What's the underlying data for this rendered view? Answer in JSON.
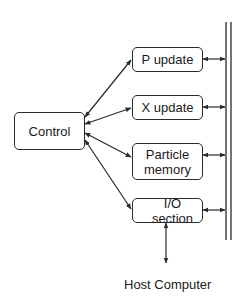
{
  "diagram": {
    "nodes": {
      "control": {
        "label": "Control"
      },
      "p_update": {
        "label": "P update"
      },
      "x_update": {
        "label": "X update"
      },
      "particle_memory": {
        "label": "Particle\nmemory"
      },
      "io_section": {
        "label": "I/O section"
      }
    },
    "external": {
      "host_computer": "Host Computer"
    },
    "edges": [
      {
        "from": "control",
        "to": "p_update",
        "type": "arrow"
      },
      {
        "from": "control",
        "to": "x_update",
        "type": "arrow"
      },
      {
        "from": "control",
        "to": "particle_memory",
        "type": "arrow"
      },
      {
        "from": "control",
        "to": "io_section",
        "type": "arrow"
      },
      {
        "from": "p_update",
        "to": "bus",
        "type": "bidirectional"
      },
      {
        "from": "x_update",
        "to": "bus",
        "type": "bidirectional"
      },
      {
        "from": "particle_memory",
        "to": "bus",
        "type": "bidirectional"
      },
      {
        "from": "io_section",
        "to": "bus",
        "type": "bidirectional"
      },
      {
        "from": "io_section",
        "to": "host_computer",
        "type": "bidirectional"
      }
    ],
    "colors": {
      "stroke": "#2a2a2a",
      "background": "#ffffff",
      "text": "#1a1a1a"
    }
  }
}
